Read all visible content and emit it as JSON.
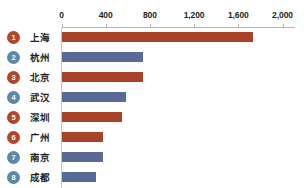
{
  "chart_data": {
    "type": "bar",
    "orientation": "horizontal",
    "title": "",
    "xlabel": "",
    "ylabel": "",
    "xlim": [
      0,
      2000
    ],
    "xticks": [
      0,
      400,
      800,
      1200,
      1600,
      2000
    ],
    "xtick_labels": [
      "0",
      "400",
      "800",
      "1,200",
      "1,600",
      "2,000"
    ],
    "grid": false,
    "legend": "none",
    "categories": [
      "上海",
      "杭州",
      "北京",
      "武汉",
      "深圳",
      "广州",
      "南京",
      "成都"
    ],
    "values": [
      1730,
      740,
      740,
      580,
      550,
      380,
      380,
      315
    ],
    "bar_colors": [
      "#a8432a",
      "#5a6a96",
      "#a8432a",
      "#5a6a96",
      "#a8432a",
      "#a8432a",
      "#5a6a96",
      "#5a6a96"
    ]
  },
  "axis": {
    "ticks": [
      {
        "label": "0",
        "value": 0
      },
      {
        "label": "400",
        "value": 400
      },
      {
        "label": "800",
        "value": 800
      },
      {
        "label": "1,200",
        "value": 1200
      },
      {
        "label": "1,600",
        "value": 1600
      },
      {
        "label": "2,000",
        "value": 2000
      }
    ],
    "line_color": "#b9b6b2"
  },
  "rows": [
    {
      "rank": "1",
      "label": "上海",
      "value": 1730,
      "color": "#a8432a",
      "badge_color": "#b0462c"
    },
    {
      "rank": "2",
      "label": "杭州",
      "value": 740,
      "color": "#5a6a96",
      "badge_color": "#5d88a8"
    },
    {
      "rank": "3",
      "label": "北京",
      "value": 740,
      "color": "#a8432a",
      "badge_color": "#b0462c"
    },
    {
      "rank": "4",
      "label": "武汉",
      "value": 580,
      "color": "#5a6a96",
      "badge_color": "#5d88a8"
    },
    {
      "rank": "5",
      "label": "深圳",
      "value": 550,
      "color": "#a8432a",
      "badge_color": "#b0462c"
    },
    {
      "rank": "6",
      "label": "广州",
      "value": 380,
      "color": "#a8432a",
      "badge_color": "#b0462c"
    },
    {
      "rank": "7",
      "label": "南京",
      "value": 380,
      "color": "#5a6a96",
      "badge_color": "#5d88a8"
    },
    {
      "rank": "8",
      "label": "成都",
      "value": 315,
      "color": "#5a6a96",
      "badge_color": "#5d88a8"
    }
  ],
  "colors": {
    "red": "#a8432a",
    "blue": "#5a6a96",
    "badge_red": "#b0462c",
    "badge_blue": "#5d88a8",
    "axis": "#b9b6b2",
    "text": "#231f20",
    "background": "#ffffff"
  }
}
